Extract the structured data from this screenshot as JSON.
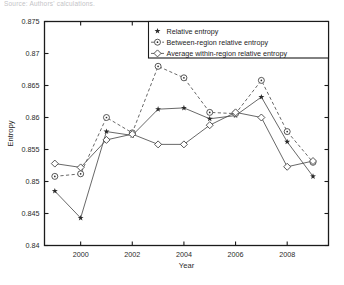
{
  "caption": "Source: Authors' calculations.",
  "chart_data": {
    "type": "line",
    "title": "",
    "xlabel": "Year",
    "ylabel": "Entropy",
    "xlim": [
      1998.6,
      2009.6
    ],
    "ylim": [
      0.84,
      0.875
    ],
    "xticks": [
      2000,
      2002,
      2004,
      2006,
      2008
    ],
    "xticklabels": [
      "2000",
      "2002",
      "2004",
      "2006",
      "2008"
    ],
    "yticks": [
      0.84,
      0.845,
      0.85,
      0.855,
      0.86,
      0.865,
      0.87,
      0.875
    ],
    "yticklabels": [
      "0.84",
      "0.845",
      "0.85",
      "0.855",
      "0.86",
      "0.865",
      "0.87",
      "0.875"
    ],
    "grid": false,
    "legend_position": "top-right",
    "x": [
      1999,
      2000,
      2001,
      2002,
      2003,
      2004,
      2005,
      2006,
      2007,
      2008,
      2009
    ],
    "series": [
      {
        "name": "Relative entropy",
        "marker": "star",
        "linestyle": "solid",
        "values": [
          0.8485,
          0.8443,
          0.8578,
          0.8572,
          0.8613,
          0.8615,
          0.8598,
          0.8603,
          0.8632,
          0.8562,
          0.8508
        ]
      },
      {
        "name": "Between-region relative entropy",
        "marker": "circle-dot",
        "linestyle": "dashed",
        "values": [
          0.8508,
          0.8512,
          0.86,
          0.8576,
          0.868,
          0.8662,
          0.8608,
          0.8606,
          0.8658,
          0.8578,
          0.853
        ]
      },
      {
        "name": "Average within-region relative entropy",
        "marker": "diamond",
        "linestyle": "solid",
        "values": [
          0.8528,
          0.8522,
          0.8565,
          0.8574,
          0.8558,
          0.8558,
          0.8588,
          0.8608,
          0.86,
          0.8523,
          0.8532
        ]
      }
    ],
    "legend": [
      "Relative entropy",
      "Between-region relative entropy",
      "Average within-region relative entropy"
    ]
  }
}
